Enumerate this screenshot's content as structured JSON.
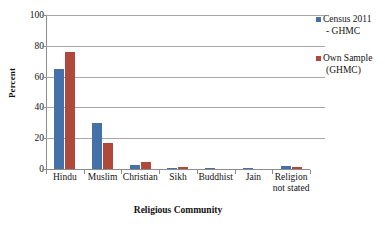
{
  "chart_data": {
    "type": "bar",
    "title": "",
    "xlabel": "Religious Community",
    "ylabel": "Percent",
    "ylim": [
      0,
      100
    ],
    "ytick_values": [
      0,
      20,
      40,
      60,
      80,
      100
    ],
    "ytick_labels": [
      "0",
      "20",
      "40",
      "60",
      "80",
      "100"
    ],
    "grid": true,
    "legend_position": "right",
    "categories": [
      "Hindu",
      "Muslim",
      "Christian",
      "Sikh",
      "Buddhist",
      "Jain",
      "Religion not stated"
    ],
    "category_lines": [
      [
        "Hindu"
      ],
      [
        "Muslim"
      ],
      [
        "Christian"
      ],
      [
        "Sikh"
      ],
      [
        "Buddhist"
      ],
      [
        "Jain"
      ],
      [
        "Religion",
        "not stated"
      ]
    ],
    "series": [
      {
        "name": "Census 2011 - GHMC",
        "name_lines": [
          "Census 2011",
          "- GHMC"
        ],
        "color": "#4472a8",
        "values": [
          64.8,
          30.1,
          2.9,
          0.1,
          0.1,
          0.1,
          2.0
        ]
      },
      {
        "name": "Own Sample (GHMC)",
        "name_lines": [
          "Own Sample",
          "(GHMC)"
        ],
        "color": "#b0483b",
        "values": [
          76.2,
          16.8,
          4.8,
          1.0,
          0.0,
          0.0,
          1.5
        ]
      }
    ]
  },
  "legend": {
    "entries": [
      {
        "line1": "Census 2011",
        "line2": "- GHMC"
      },
      {
        "line1": "Own Sample",
        "line2": "(GHMC)"
      }
    ]
  },
  "axes": {
    "y_title": "Percent",
    "x_title": "Religious Community"
  },
  "colors": {
    "series_0": "#4472a8",
    "series_1": "#b0483b",
    "gridline": "#a6a6a6",
    "axis": "#8c8c8c",
    "text": "#111111",
    "background": "#ffffff"
  }
}
